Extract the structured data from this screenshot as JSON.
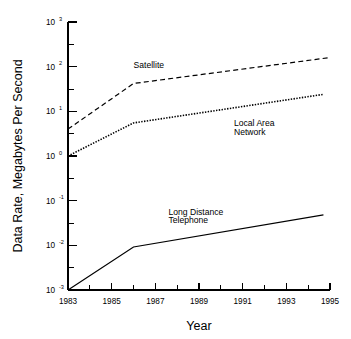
{
  "chart_data": {
    "type": "line",
    "title": "",
    "xlabel": "Year",
    "ylabel": "Data Rate, Megabytes Per Second",
    "xlim": [
      1983,
      1995
    ],
    "ylim": [
      0.001,
      1000
    ],
    "yscale": "log",
    "grid": false,
    "legend": "inline-annotations",
    "x_tick_labels": [
      "1983",
      "1985",
      "1987",
      "1989",
      "1991",
      "1993",
      "1995"
    ],
    "x_tick_values": [
      1983,
      1985,
      1987,
      1989,
      1991,
      1993,
      1995
    ],
    "x_minor_tick_values": [
      1984,
      1986,
      1988,
      1990,
      1992,
      1994
    ],
    "y_tick_labels": [
      "10 3",
      "10 2",
      "10 1",
      "10 0",
      "10 -1",
      "10 -2",
      "10 -3"
    ],
    "y_tick_mantissa": [
      "10",
      "10",
      "10",
      "10",
      "10",
      "10",
      "10"
    ],
    "y_tick_exponents": [
      "3",
      "2",
      "1",
      "0",
      "-1",
      "-2",
      "-3"
    ],
    "y_tick_values": [
      1000,
      100,
      10,
      1,
      0.1,
      0.01,
      0.001
    ],
    "y_minor_tick_values": [
      316.2,
      31.62,
      3.162,
      0.3162,
      0.03162,
      0.003162
    ],
    "series": [
      {
        "name": "Satellite",
        "label": "Satellite",
        "label_lines": [
          "Satellite"
        ],
        "style": "dashed",
        "color": "#000000",
        "x": [
          1983,
          1986,
          1995
        ],
        "values": [
          4.0,
          42.0,
          160.0
        ]
      },
      {
        "name": "Local Area Network",
        "label": "Local Area Network",
        "label_lines": [
          "Local Area",
          "Network"
        ],
        "style": "dotted",
        "color": "#000000",
        "x": [
          1983,
          1986,
          1994.7
        ],
        "values": [
          1.0,
          5.5,
          24.0
        ]
      },
      {
        "name": "Long Distance Telephone",
        "label": "Long Distance Telephone",
        "label_lines": [
          "Long Distance",
          "Telephone"
        ],
        "style": "solid",
        "color": "#000000",
        "x": [
          1983,
          1986,
          1994.7
        ],
        "values": [
          0.001,
          0.0092,
          0.048
        ]
      }
    ],
    "annotations": [
      {
        "text": "Satellite",
        "x": 1986.0,
        "y": 95.0
      },
      {
        "text": "Local Area",
        "x": 1990.6,
        "y": 4.6
      },
      {
        "text": "Network",
        "x": 1990.6,
        "y": 3.0
      },
      {
        "text": "Long Distance",
        "x": 1987.6,
        "y": 0.048
      },
      {
        "text": "Telephone",
        "x": 1987.6,
        "y": 0.032
      }
    ]
  }
}
